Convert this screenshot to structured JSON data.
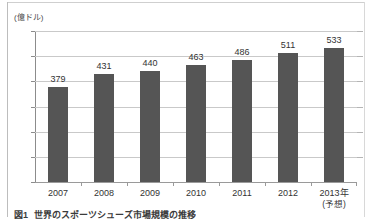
{
  "figure": {
    "unit_label": "(億ドル)",
    "caption_number": "図1",
    "caption_text": "世界のスポーツシューズ市場規模の推移"
  },
  "chart_data": {
    "type": "bar",
    "title": "世界のスポーツシューズ市場規模の推移",
    "xlabel": "",
    "ylabel": "(億ドル)",
    "ylim": [
      0,
      600
    ],
    "yticks": [
      0,
      100,
      200,
      300,
      400,
      500,
      600
    ],
    "ytick_labels": [
      "0",
      "100",
      "200",
      "300",
      "400",
      "500",
      "600"
    ],
    "grid": true,
    "legend": false,
    "bar_color": "#555555",
    "gridline_color": "#c9c9c9",
    "categories": [
      "2007",
      "2008",
      "2009",
      "2010",
      "2011",
      "2012",
      "2013年"
    ],
    "category_sublabels": [
      "",
      "",
      "",
      "",
      "",
      "",
      "(予想)"
    ],
    "values": [
      379,
      431,
      440,
      463,
      486,
      511,
      533
    ],
    "value_labels": [
      "379",
      "431",
      "440",
      "463",
      "486",
      "511",
      "533"
    ],
    "annotations": [
      "2013年は予想値"
    ]
  }
}
